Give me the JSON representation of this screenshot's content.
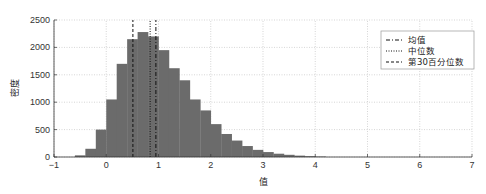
{
  "chart_data": {
    "type": "bar",
    "subtype": "histogram",
    "title": "",
    "xlabel": "值",
    "ylabel": "密度",
    "xlim": [
      -1,
      7
    ],
    "ylim": [
      0,
      2500
    ],
    "xticks": [
      -1,
      0,
      1,
      2,
      3,
      4,
      5,
      6,
      7
    ],
    "yticks": [
      0,
      500,
      1000,
      1500,
      2000,
      2500
    ],
    "grid": true,
    "bar_color": "#6b6b6b",
    "bin_width": 0.2,
    "bin_edges_start": -0.6,
    "categories": [
      "-0.6",
      "-0.4",
      "-0.2",
      "0.0",
      "0.2",
      "0.4",
      "0.6",
      "0.8",
      "1.0",
      "1.2",
      "1.4",
      "1.6",
      "1.8",
      "2.0",
      "2.2",
      "2.4",
      "2.6",
      "2.8",
      "3.0",
      "3.2",
      "3.4",
      "3.6",
      "3.8",
      "4.0"
    ],
    "values": [
      30,
      150,
      500,
      1050,
      1700,
      2150,
      2280,
      2200,
      1950,
      1620,
      1400,
      1050,
      850,
      600,
      420,
      300,
      200,
      130,
      90,
      60,
      40,
      25,
      15,
      8
    ],
    "vlines": [
      {
        "name": "均值",
        "x": 0.95,
        "style": "dashdot"
      },
      {
        "name": "中位数",
        "x": 0.84,
        "style": "dotted"
      },
      {
        "name": "第30百分位数",
        "x": 0.51,
        "style": "dashed"
      }
    ],
    "legend": {
      "position": "upper right",
      "entries": [
        "均值",
        "中位数",
        "第30百分位数"
      ]
    }
  }
}
